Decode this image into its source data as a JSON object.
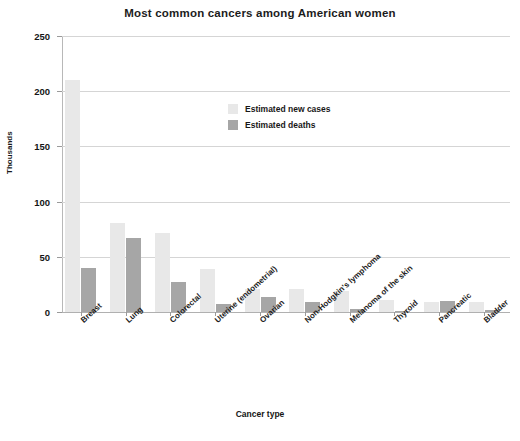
{
  "chart_data": {
    "type": "bar",
    "title": "Most common cancers among American women",
    "xlabel": "Cancer type",
    "ylabel": "Thousands",
    "ylim": [
      0,
      250
    ],
    "yticks": [
      0,
      50,
      100,
      150,
      200,
      250
    ],
    "grid": true,
    "legend_position": "inside-top-center",
    "categories": [
      "Breast",
      "Lung",
      "Colorectal",
      "Uterine (endometrial)",
      "Ovarian",
      "Non-Hodgkin's lymphoma",
      "Melanoma of the skin",
      "Thyroid",
      "Pancreatic",
      "Bladder"
    ],
    "series": [
      {
        "name": "Estimated new cases",
        "color": "#e8e8e8",
        "values": [
          210,
          81,
          72,
          39,
          21,
          21,
          19,
          11,
          9,
          9
        ]
      },
      {
        "name": "Estimated deaths",
        "color": "#a6a6a6",
        "values": [
          40,
          67,
          27,
          7,
          14,
          9,
          3,
          1,
          10,
          2
        ]
      }
    ]
  },
  "axis": {
    "y_tick_labels": [
      "0",
      "50",
      "100",
      "150",
      "200",
      "250"
    ]
  },
  "colors": {
    "cases": "#e8e8e8",
    "deaths": "#a6a6a6",
    "grid": "#d5d5d5",
    "text": "#1a1a1a"
  }
}
